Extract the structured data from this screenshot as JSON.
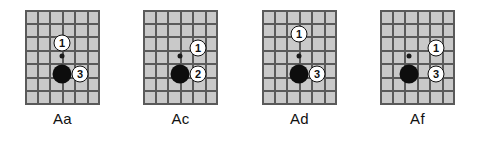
{
  "figure": {
    "background_color": "#ffffff",
    "board_color": "#c9c9c9",
    "line_color": "#5a5a5a",
    "stone_color": "#0d0d0d",
    "marker_fill": "#ffffff",
    "marker_text_color": "#101010"
  },
  "diagrams": [
    {
      "caption": "Aa",
      "left": 25,
      "board": {
        "cols": 6,
        "rows": 7
      },
      "star_point": {
        "x": 37,
        "y": 46
      },
      "stones": [
        {
          "color": "black",
          "x": 37,
          "y": 64
        }
      ],
      "markers": [
        {
          "label": "1",
          "x": 37,
          "y": 33
        },
        {
          "label": "3",
          "x": 55,
          "y": 64
        }
      ]
    },
    {
      "caption": "Ac",
      "left": 143,
      "board": {
        "cols": 6,
        "rows": 7
      },
      "star_point": {
        "x": 37,
        "y": 46
      },
      "stones": [
        {
          "color": "black",
          "x": 37,
          "y": 64
        }
      ],
      "markers": [
        {
          "label": "1",
          "x": 55,
          "y": 38
        },
        {
          "label": "2",
          "x": 55,
          "y": 64
        }
      ]
    },
    {
      "caption": "Ad",
      "left": 262,
      "board": {
        "cols": 6,
        "rows": 7
      },
      "star_point": {
        "x": 37,
        "y": 46
      },
      "stones": [
        {
          "color": "black",
          "x": 37,
          "y": 64
        }
      ],
      "markers": [
        {
          "label": "1",
          "x": 37,
          "y": 24
        },
        {
          "label": "3",
          "x": 55,
          "y": 64
        }
      ]
    },
    {
      "caption": "Af",
      "left": 380,
      "board": {
        "cols": 6,
        "rows": 7
      },
      "star_point": {
        "x": 29,
        "y": 46
      },
      "stones": [
        {
          "color": "black",
          "x": 29,
          "y": 64
        }
      ],
      "markers": [
        {
          "label": "1",
          "x": 56,
          "y": 38
        },
        {
          "label": "3",
          "x": 56,
          "y": 64
        }
      ]
    }
  ]
}
